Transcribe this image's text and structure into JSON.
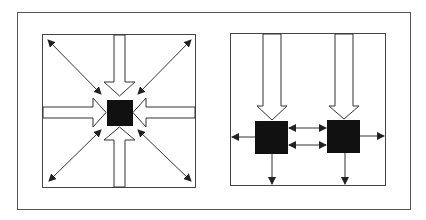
{
  "figure": {
    "colors": {
      "stroke": "#333333",
      "node_fill": "#111111",
      "background": "#ffffff"
    },
    "panels": [
      {
        "id": "left",
        "layout": "centralized",
        "nodes": 1,
        "hollow_arrows_in": [
          "top",
          "bottom",
          "left",
          "right"
        ],
        "double_arrows_diagonal": [
          "top-left",
          "top-right",
          "bottom-left",
          "bottom-right"
        ]
      },
      {
        "id": "right",
        "layout": "linear-pair",
        "nodes": 2,
        "hollow_arrows_in": [
          "top-node-1",
          "top-node-2"
        ],
        "double_arrows_between_nodes": 2,
        "single_arrows_out": [
          "left",
          "right",
          "down-node-1",
          "down-node-2"
        ]
      }
    ]
  }
}
